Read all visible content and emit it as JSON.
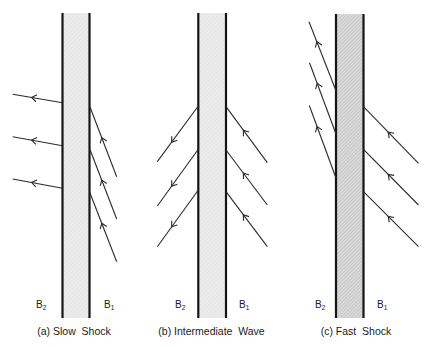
{
  "figure": {
    "colors": {
      "ink": "#141414",
      "line": "#2a2a2a",
      "shade_light": "#ececec",
      "shade_light_hatch": "#dddddd",
      "shade_dark": "#dadada",
      "shade_dark_hatch": "#b8b8b8"
    },
    "panels": [
      {
        "id": "a",
        "caption": "(a) Slow  Shock",
        "label_downstream": "B",
        "label_downstream_sub": "2",
        "label_upstream": "B",
        "label_upstream_sub": "1",
        "shade": "light",
        "walls": {
          "left_x": 62.5,
          "right_x": 89.5,
          "top": 13,
          "bottom": 318
        },
        "field_lines": [
          {
            "side": "downstream",
            "from": [
              62.5,
              102.7
            ],
            "to": [
              12.7,
              94.3
            ],
            "arrow_at": 0.62
          },
          {
            "side": "downstream",
            "from": [
              62.5,
              145.7
            ],
            "to": [
              12.7,
              136.7
            ],
            "arrow_at": 0.62
          },
          {
            "side": "downstream",
            "from": [
              62.5,
              188.3
            ],
            "to": [
              12.7,
              179.0
            ],
            "arrow_at": 0.62
          },
          {
            "side": "upstream",
            "from": [
              116.7,
              176.7
            ],
            "to": [
              89.5,
              105.7
            ],
            "arrow_at": 0.55
          },
          {
            "side": "upstream",
            "from": [
              116.7,
              219.0
            ],
            "to": [
              89.5,
              148.3
            ],
            "arrow_at": 0.55
          },
          {
            "side": "upstream",
            "from": [
              116.7,
              261.7
            ],
            "to": [
              89.5,
              191.7
            ],
            "arrow_at": 0.55
          }
        ]
      },
      {
        "id": "b",
        "caption": "(b) Intermediate  Wave",
        "label_downstream": "B",
        "label_downstream_sub": "2",
        "label_upstream": "B",
        "label_upstream_sub": "1",
        "shade": "light",
        "walls": {
          "left_x": 198.3,
          "right_x": 226.0,
          "top": 13,
          "bottom": 318
        },
        "field_lines": [
          {
            "side": "downstream",
            "from": [
              198.3,
              106.0
            ],
            "to": [
              157.3,
              161.7
            ],
            "arrow_at": 0.65
          },
          {
            "side": "downstream",
            "from": [
              198.3,
              149.3
            ],
            "to": [
              157.3,
              206.0
            ],
            "arrow_at": 0.65
          },
          {
            "side": "downstream",
            "from": [
              198.3,
              190.0
            ],
            "to": [
              157.3,
              246.7
            ],
            "arrow_at": 0.65
          },
          {
            "side": "upstream",
            "from": [
              267.3,
              162.7
            ],
            "to": [
              226.0,
              106.7
            ],
            "arrow_at": 0.58
          },
          {
            "side": "upstream",
            "from": [
              267.3,
              205.0
            ],
            "to": [
              226.0,
              150.0
            ],
            "arrow_at": 0.58
          },
          {
            "side": "upstream",
            "from": [
              267.3,
              246.7
            ],
            "to": [
              226.0,
              191.7
            ],
            "arrow_at": 0.58
          }
        ]
      },
      {
        "id": "c",
        "caption": "(c) Fast  Shock",
        "label_downstream": "B",
        "label_downstream_sub": "2",
        "label_upstream": "B",
        "label_upstream_sub": "1",
        "shade": "dark",
        "walls": {
          "left_x": 336.0,
          "right_x": 363.5,
          "top": 14,
          "bottom": 318
        },
        "field_lines": [
          {
            "side": "downstream",
            "from": [
              336.0,
              90.7
            ],
            "to": [
              309.0,
              21.7
            ],
            "arrow_at": 0.71
          },
          {
            "side": "downstream",
            "from": [
              336.0,
              134.0
            ],
            "to": [
              309.5,
              62.7
            ],
            "arrow_at": 0.71
          },
          {
            "side": "downstream",
            "from": [
              336.0,
              178.0
            ],
            "to": [
              309.3,
              105.5
            ],
            "arrow_at": 0.71
          },
          {
            "side": "upstream",
            "from": [
              418.5,
              163.3
            ],
            "to": [
              363.5,
              106.7
            ],
            "arrow_at": 0.55
          },
          {
            "side": "upstream",
            "from": [
              418.5,
              205.0
            ],
            "to": [
              363.5,
              149.3
            ],
            "arrow_at": 0.55
          },
          {
            "side": "upstream",
            "from": [
              418.5,
              246.7
            ],
            "to": [
              363.5,
              191.7
            ],
            "arrow_at": 0.55
          }
        ]
      }
    ]
  }
}
